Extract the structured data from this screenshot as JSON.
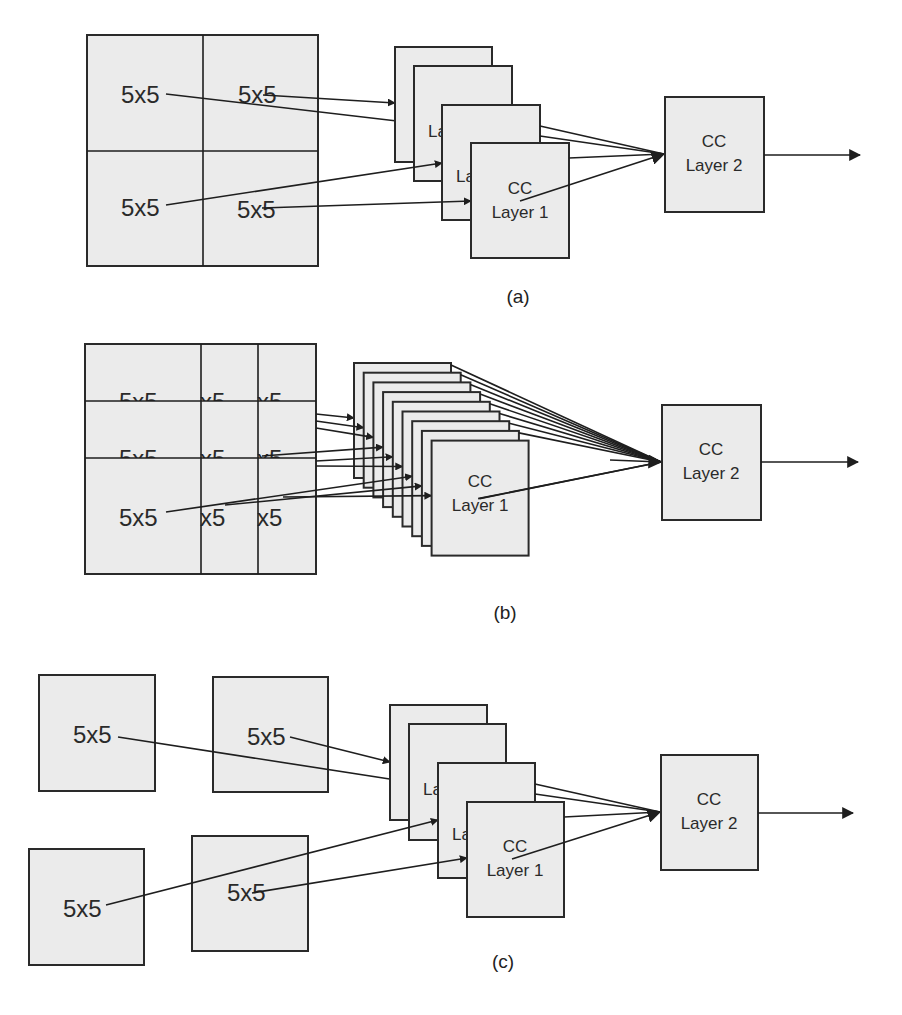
{
  "diagram": {
    "panels": [
      {
        "id": "a",
        "caption": "(a)",
        "input_layout": "2x2 grid of adjacent tiles",
        "tiles": [
          "5x5",
          "5x5",
          "5x5",
          "5x5"
        ],
        "layer1": {
          "label_line1": "CC",
          "label_line2": "Layer 1",
          "stack_count": 4
        },
        "layer2": {
          "label_line1": "CC",
          "label_line2": "Layer 2"
        }
      },
      {
        "id": "b",
        "caption": "(b)",
        "input_layout": "3x3 grid of overlapping tiles",
        "tiles": [
          "5x5",
          "x5",
          "x5",
          "5x5",
          "x5",
          "x5",
          "5x5",
          "x5",
          "x5"
        ],
        "layer1": {
          "label_line1": "CC",
          "label_line2": "Layer 1",
          "stack_count": 9
        },
        "layer2": {
          "label_line1": "CC",
          "label_line2": "Layer 2"
        }
      },
      {
        "id": "c",
        "caption": "(c)",
        "input_layout": "4 separated tiles",
        "tiles": [
          "5x5",
          "5x5",
          "5x5",
          "5x5"
        ],
        "layer1": {
          "label_line1": "CC",
          "label_line2": "Layer 1",
          "stack_count": 4
        },
        "layer2": {
          "label_line1": "CC",
          "label_line2": "Layer 2"
        }
      }
    ],
    "colors": {
      "box_fill": "#ebebeb",
      "stroke": "#2a2a2a"
    }
  }
}
